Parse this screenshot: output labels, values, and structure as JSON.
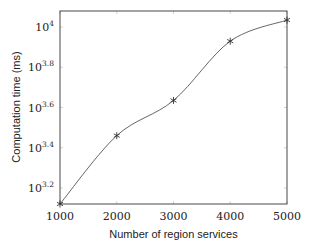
{
  "chart_data": {
    "type": "line",
    "title": "",
    "xlabel": "Number of region services",
    "ylabel": "Computation time (ms)",
    "yscale": "log10",
    "x": [
      1000,
      2000,
      3000,
      4000,
      5000
    ],
    "series": [
      {
        "name": "Computation time",
        "marker": "asterisk",
        "smooth": true,
        "values_log10": [
          3.12,
          3.46,
          3.635,
          3.93,
          4.035
        ],
        "values": [
          1318,
          2884,
          4315,
          8511,
          10839
        ]
      }
    ],
    "xlim": [
      1000,
      5000
    ],
    "ylim_log10": [
      3.12,
      4.08
    ],
    "xticks": [
      "1000",
      "2000",
      "3000",
      "4000",
      "5000"
    ],
    "yticks": [
      {
        "base": "10",
        "exp": "3.2",
        "log": 3.2
      },
      {
        "base": "10",
        "exp": "3.4",
        "log": 3.4
      },
      {
        "base": "10",
        "exp": "3.6",
        "log": 3.6
      },
      {
        "base": "10",
        "exp": "3.8",
        "log": 3.8
      },
      {
        "base": "10",
        "exp": "4",
        "log": 4.0
      }
    ],
    "grid": false,
    "legend": null
  },
  "style": {
    "line_color": "#555555",
    "axis_color": "#333333"
  }
}
